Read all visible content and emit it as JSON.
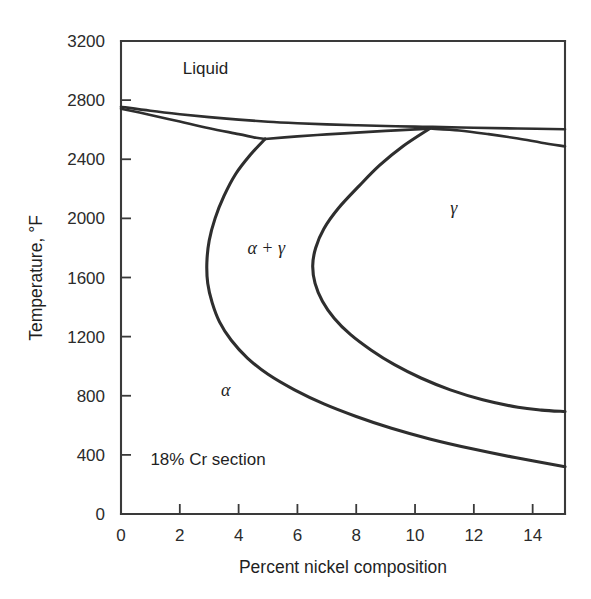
{
  "figure": {
    "title_note": "18% Cr section",
    "background_color": "#ffffff",
    "line_color": "#2e2e2e"
  },
  "chart_data": {
    "type": "line",
    "title": "",
    "subtitle": "",
    "xlabel": "Percent nickel composition",
    "ylabel": "Temperature, °F",
    "xlim": [
      0,
      15.1
    ],
    "ylim": [
      0,
      3200
    ],
    "grid": false,
    "legend_position": "none",
    "annotation_note": "18% Cr section",
    "x_ticks": [
      0,
      2,
      4,
      6,
      8,
      10,
      12,
      14
    ],
    "x_tick_labels": [
      "0",
      "2",
      "4",
      "6",
      "8",
      "10",
      "12",
      "14"
    ],
    "y_ticks": [
      0,
      400,
      800,
      1200,
      1600,
      2000,
      2400,
      2800,
      3200
    ],
    "y_tick_labels": [
      "0",
      "400",
      "800",
      "1200",
      "1600",
      "2000",
      "2400",
      "2800",
      "3200"
    ],
    "region_labels": [
      {
        "text": "Liquid",
        "x": 2.1,
        "y": 2980,
        "style": "roman"
      },
      {
        "text": "γ",
        "x": 11.2,
        "y": 2030,
        "style": "greek"
      },
      {
        "text": "α + γ",
        "x": 4.3,
        "y": 1760,
        "style": "greek"
      },
      {
        "text": "α",
        "x": 3.4,
        "y": 800,
        "style": "greek"
      },
      {
        "text": "18% Cr section",
        "x": 1.0,
        "y": 330,
        "style": "roman"
      }
    ],
    "series": [
      {
        "name": "liquidus",
        "comment": "upper boundary of Liquid field, falls from ~2755 F at 0% Ni toward right edge",
        "points": [
          [
            0.0,
            2755
          ],
          [
            1.0,
            2728
          ],
          [
            2.0,
            2705
          ],
          [
            3.0,
            2685
          ],
          [
            4.0,
            2668
          ],
          [
            5.0,
            2654
          ],
          [
            6.0,
            2644
          ],
          [
            7.0,
            2636
          ],
          [
            8.0,
            2630
          ],
          [
            9.0,
            2625
          ],
          [
            10.0,
            2621
          ],
          [
            10.6,
            2619
          ],
          [
            12.0,
            2613
          ],
          [
            13.5,
            2608
          ],
          [
            15.1,
            2603
          ]
        ]
      },
      {
        "name": "solidus-delta",
        "comment": "lower boundary from 0% Ni down to the three-phase junction near 4.9% Ni",
        "points": [
          [
            0.0,
            2742
          ],
          [
            1.0,
            2700
          ],
          [
            2.0,
            2655
          ],
          [
            3.0,
            2610
          ],
          [
            4.0,
            2570
          ],
          [
            4.6,
            2545
          ],
          [
            4.9,
            2537
          ]
        ]
      },
      {
        "name": "solidus-right",
        "comment": "near-flat boundary from junction at 4.9% Ni rightward to ~10.5% Ni",
        "points": [
          [
            4.9,
            2537
          ],
          [
            6.0,
            2555
          ],
          [
            7.0,
            2568
          ],
          [
            8.0,
            2580
          ],
          [
            9.0,
            2592
          ],
          [
            10.0,
            2602
          ],
          [
            10.5,
            2608
          ]
        ]
      },
      {
        "name": "solidus-far-right",
        "comment": "lower solidus descending past 10.5% Ni to right edge",
        "points": [
          [
            10.5,
            2608
          ],
          [
            11.5,
            2595
          ],
          [
            12.5,
            2570
          ],
          [
            13.5,
            2540
          ],
          [
            14.3,
            2512
          ],
          [
            15.1,
            2487
          ]
        ]
      },
      {
        "name": "alpha-gamma-left-boundary",
        "comment": "alpha / (alpha+gamma) phase boundary: C-shaped curve from junction at 4.9% Ni, 2537 F bulging left to ~2.9% Ni near 1600 F then sweeping down-right to ~15.1% Ni at 320 F",
        "points": [
          [
            4.9,
            2537
          ],
          [
            4.4,
            2430
          ],
          [
            3.9,
            2300
          ],
          [
            3.5,
            2150
          ],
          [
            3.2,
            2000
          ],
          [
            3.0,
            1850
          ],
          [
            2.92,
            1700
          ],
          [
            2.95,
            1560
          ],
          [
            3.1,
            1430
          ],
          [
            3.35,
            1300
          ],
          [
            3.75,
            1175
          ],
          [
            4.3,
            1055
          ],
          [
            5.0,
            945
          ],
          [
            5.9,
            840
          ],
          [
            6.9,
            745
          ],
          [
            8.0,
            660
          ],
          [
            9.2,
            580
          ],
          [
            10.5,
            508
          ],
          [
            11.9,
            443
          ],
          [
            13.4,
            382
          ],
          [
            15.1,
            320
          ]
        ]
      },
      {
        "name": "gamma-alpha-right-boundary",
        "comment": "(alpha+gamma) / gamma phase boundary: C-shaped curve from ~10.5% Ni, 2608 F bulging left to ~6.5% Ni near 1750 F then sweeping down-right to ~15.1% Ni at 700 F",
        "points": [
          [
            10.5,
            2608
          ],
          [
            9.6,
            2490
          ],
          [
            8.8,
            2360
          ],
          [
            8.1,
            2220
          ],
          [
            7.4,
            2070
          ],
          [
            6.9,
            1930
          ],
          [
            6.62,
            1800
          ],
          [
            6.52,
            1680
          ],
          [
            6.6,
            1560
          ],
          [
            6.85,
            1440
          ],
          [
            7.25,
            1325
          ],
          [
            7.8,
            1215
          ],
          [
            8.5,
            1110
          ],
          [
            9.3,
            1010
          ],
          [
            10.2,
            920
          ],
          [
            11.2,
            840
          ],
          [
            12.3,
            773
          ],
          [
            13.5,
            722
          ],
          [
            14.3,
            703
          ],
          [
            15.1,
            693
          ]
        ]
      }
    ]
  },
  "axes": {
    "x_title": "Percent nickel composition",
    "y_title": "Temperature, °F"
  }
}
